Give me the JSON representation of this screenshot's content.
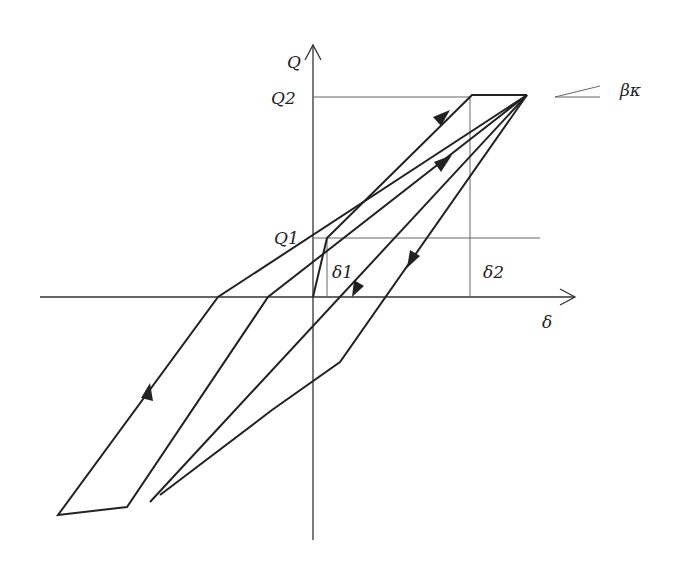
{
  "diagram": {
    "type": "hysteresis-loop",
    "axes": {
      "x_label": "δ",
      "y_label": "Q"
    },
    "labels": {
      "q1": "Q1",
      "q2": "Q2",
      "d1": "δ1",
      "d2": "δ2",
      "slope": "βκ"
    },
    "colors": {
      "line": "#222222",
      "guide": "#555555"
    }
  }
}
